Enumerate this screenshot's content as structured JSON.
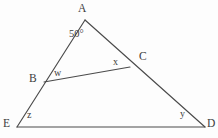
{
  "figure": {
    "type": "geometry-diagram",
    "background_color": "#fdfdfd",
    "line_color": "#4a4a4a",
    "text_color": "#3c3c3c",
    "width": 218,
    "height": 138,
    "vertices": [
      {
        "id": "A",
        "label": "A",
        "x": 85,
        "y": 20,
        "label_x": 78,
        "label_y": 3
      },
      {
        "id": "B",
        "label": "B",
        "x": 44,
        "y": 82,
        "label_x": 29,
        "label_y": 73
      },
      {
        "id": "C",
        "label": "C",
        "x": 130,
        "y": 67,
        "label_x": 139,
        "label_y": 51
      },
      {
        "id": "E",
        "label": "E",
        "x": 17,
        "y": 127,
        "label_x": 3,
        "label_y": 118
      },
      {
        "id": "D",
        "label": "D",
        "x": 205,
        "y": 127,
        "label_x": 207,
        "label_y": 118
      }
    ],
    "segments": [
      {
        "id": "AE",
        "from": "A",
        "to": "E",
        "x1": 85,
        "y1": 20,
        "x2": 17,
        "y2": 127
      },
      {
        "id": "AD",
        "from": "A",
        "to": "D",
        "x1": 85,
        "y1": 20,
        "x2": 205,
        "y2": 127
      },
      {
        "id": "ED",
        "from": "E",
        "to": "D",
        "x1": 17,
        "y1": 127,
        "x2": 205,
        "y2": 127
      },
      {
        "id": "BC",
        "from": "B",
        "to": "C",
        "x1": 44,
        "y1": 82,
        "x2": 130,
        "y2": 67
      }
    ],
    "angles": [
      {
        "id": "angle-A",
        "label": "50°",
        "at_vertex": "A",
        "label_x": 69,
        "label_y": 29,
        "value": 50,
        "known": true
      },
      {
        "id": "angle-w",
        "label": "w",
        "at_vertex": "B",
        "label_x": 54,
        "label_y": 68,
        "known": false
      },
      {
        "id": "angle-x",
        "label": "x",
        "at_vertex": "C",
        "label_x": 113,
        "label_y": 57,
        "known": false
      },
      {
        "id": "angle-z",
        "label": "z",
        "at_vertex": "E",
        "label_x": 27,
        "label_y": 110,
        "known": false
      },
      {
        "id": "angle-y",
        "label": "y",
        "at_vertex": "D",
        "label_x": 180,
        "label_y": 109,
        "known": false
      }
    ]
  }
}
